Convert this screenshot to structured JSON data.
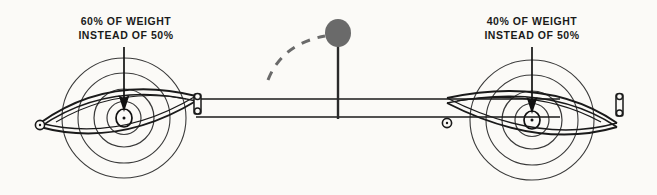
{
  "figure": {
    "background_color": "#fbfaf7",
    "ink_color": "#1a1a1a",
    "accent_gray": "#6a6a6a",
    "width": 657,
    "height": 195
  },
  "callouts": {
    "left": {
      "line1": "60% OF WEIGHT",
      "line2": "INSTEAD OF 50%",
      "percent": "60%",
      "baseline_percent": "50%"
    },
    "right": {
      "line1": "40% OF WEIGHT",
      "line2": "INSTEAD OF 50%",
      "percent": "40%",
      "baseline_percent": "50%"
    }
  },
  "elements": {
    "left_wheel": {
      "name": "left-wheel",
      "center_x": 124,
      "center_y": 118
    },
    "right_wheel": {
      "name": "right-wheel",
      "center_x": 532,
      "center_y": 120
    },
    "left_load_arrow": {
      "name": "left-load-arrow"
    },
    "right_load_arrow": {
      "name": "right-load-arrow"
    },
    "left_leaf_spring": {
      "name": "left-leaf-spring"
    },
    "right_leaf_spring": {
      "name": "right-leaf-spring"
    },
    "frame_rail": {
      "name": "frame-rail"
    },
    "shift_knob": {
      "name": "shift-knob",
      "center_x": 338,
      "center_y": 33,
      "radius": 13,
      "fill": "#6a6a6a"
    },
    "shift_lever": {
      "name": "shift-lever"
    },
    "motion_arc": {
      "name": "motion-arc-dashed",
      "style": "dashed",
      "color": "#6a6a6a"
    },
    "left_shackle": {
      "name": "left-shackle"
    },
    "right_shackle": {
      "name": "right-shackle"
    },
    "left_spring_eye": {
      "name": "left-spring-eye"
    },
    "right_spring_eye": {
      "name": "right-spring-eye"
    }
  }
}
